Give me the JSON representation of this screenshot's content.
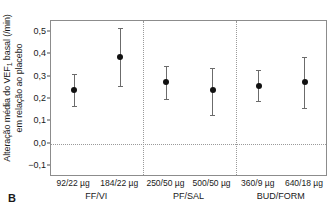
{
  "panel": {
    "letter": "B"
  },
  "chart_data": {
    "type": "scatter",
    "title": "",
    "subtitle": "",
    "xlabel": "",
    "ylabel": "Alteração média do VEF1 basal (/min) em relação ao placebo",
    "ylabel_line1": "Alteração média do VEF",
    "ylabel_sub": "1",
    "ylabel_line1_rest": " basal (/min)",
    "ylabel_line2": "em relação ao placebo",
    "ylim": [
      -0.15,
      0.55
    ],
    "yticks": [
      -0.1,
      0.0,
      0.1,
      0.2,
      0.3,
      0.4,
      0.5
    ],
    "ytick_labels": [
      "−0,1",
      "0,0",
      "0,1",
      "0,2",
      "0,3",
      "0,4",
      "0,5"
    ],
    "grid": false,
    "zero_reference_line": 0.0,
    "legend": "none",
    "categories": [
      "92/22 µg",
      "184/22 µg",
      "250/50 µg",
      "500/50 µg",
      "360/9 µg",
      "640/18 µg"
    ],
    "groups": [
      {
        "label": "FF/VI",
        "categories": [
          "92/22 µg",
          "184/22 µg"
        ]
      },
      {
        "label": "PF/SAL",
        "categories": [
          "250/50 µg",
          "500/50 µg"
        ]
      },
      {
        "label": "BUD/FORM",
        "categories": [
          "360/9 µg",
          "640/18 µg"
        ]
      }
    ],
    "values": [
      0.24,
      0.39,
      0.275,
      0.24,
      0.26,
      0.275
    ],
    "ci_low": [
      0.17,
      0.26,
      0.2,
      0.13,
      0.19,
      0.16
    ],
    "ci_high": [
      0.31,
      0.52,
      0.35,
      0.34,
      0.33,
      0.39
    ],
    "points": [
      {
        "category": "92/22 µg",
        "group": "FF/VI",
        "value": 0.24,
        "ci_low": 0.17,
        "ci_high": 0.31
      },
      {
        "category": "184/22 µg",
        "group": "FF/VI",
        "value": 0.39,
        "ci_low": 0.26,
        "ci_high": 0.52
      },
      {
        "category": "250/50 µg",
        "group": "PF/SAL",
        "value": 0.275,
        "ci_low": 0.2,
        "ci_high": 0.35
      },
      {
        "category": "500/50 µg",
        "group": "PF/SAL",
        "value": 0.24,
        "ci_low": 0.13,
        "ci_high": 0.34
      },
      {
        "category": "360/9 µg",
        "group": "BUD/FORM",
        "value": 0.26,
        "ci_low": 0.19,
        "ci_high": 0.33
      },
      {
        "category": "640/18 µg",
        "group": "BUD/FORM",
        "value": 0.275,
        "ci_low": 0.16,
        "ci_high": 0.39
      }
    ],
    "colors": {
      "marker": "#111111",
      "errorbar": "#6b6b6b",
      "axis": "#8c8c8c",
      "reference_line": "#9a9a9a",
      "separator": "#9a9a9a"
    }
  }
}
